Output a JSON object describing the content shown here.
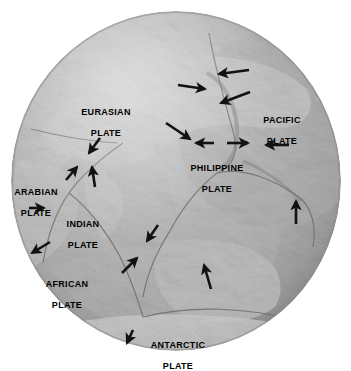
{
  "figure": {
    "kind": "relief-globe-map",
    "title_visible": false,
    "background_color": "#ffffff",
    "globe": {
      "center_x": 176,
      "center_y": 181,
      "radius_x": 165,
      "radius_y": 170,
      "shading": "grayscale shaded-relief hemisphere centered on the Indian Ocean / eastern Asia",
      "colors": {
        "ocean_light": "#c9c9c9",
        "ocean_mid": "#b4b4b4",
        "land_light": "#dcdcdc",
        "land_shadow": "#8e8e8e",
        "limb_dark": "#707070",
        "highlight": "#efefef"
      }
    },
    "labels": [
      {
        "id": "eurasian",
        "line1": "EURASIAN",
        "line2": "PLATE",
        "x": 73,
        "y": 96
      },
      {
        "id": "pacific",
        "line1": "PACIFIC",
        "line2": "PLATE",
        "x": 258,
        "y": 104
      },
      {
        "id": "philippine",
        "line1": "PHILIPPINE",
        "line2": "PLATE",
        "x": 182,
        "y": 152
      },
      {
        "id": "arabian",
        "line1": "ARABIAN",
        "line2": "PLATE",
        "x": 8,
        "y": 176
      },
      {
        "id": "indian",
        "line1": "INDIAN",
        "line2": "PLATE",
        "x": 58,
        "y": 208
      },
      {
        "id": "african",
        "line1": "AFRICAN",
        "line2": "PLATE",
        "x": 41,
        "y": 268
      },
      {
        "id": "antarctic",
        "line1": "ANTARCTIC",
        "line2": "PLATE",
        "x": 146,
        "y": 329
      }
    ],
    "arrows": [
      {
        "id": "pacific-west-north",
        "desc": "Pacific plate moving west, north of Japan",
        "x1": 249,
        "y1": 70,
        "x2": 217,
        "y2": 74
      },
      {
        "id": "pacific-west-mid",
        "desc": "Pacific plate moving west-southwest toward Japan",
        "x1": 250,
        "y1": 92,
        "x2": 219,
        "y2": 104
      },
      {
        "id": "eurasia-east",
        "desc": "Eurasian plate moving east",
        "x1": 178,
        "y1": 85,
        "x2": 207,
        "y2": 89
      },
      {
        "id": "philippine-southeast",
        "desc": "motion southeast toward Philippine trench",
        "x1": 166,
        "y1": 123,
        "x2": 192,
        "y2": 140
      },
      {
        "id": "philippine-west-1",
        "desc": "Philippine plate moving west",
        "x1": 214,
        "y1": 143,
        "x2": 194,
        "y2": 143
      },
      {
        "id": "philippine-east",
        "desc": "motion east into Pacific boundary",
        "x1": 227,
        "y1": 143,
        "x2": 250,
        "y2": 143
      },
      {
        "id": "pacific-west-south",
        "desc": "Pacific plate moving west",
        "x1": 289,
        "y1": 145,
        "x2": 264,
        "y2": 145
      },
      {
        "id": "eurasia-southwest",
        "desc": "Eurasian plate moving southwest over Himalaya",
        "x1": 100,
        "y1": 138,
        "x2": 88,
        "y2": 155
      },
      {
        "id": "arabian-northeast",
        "desc": "Arabian plate moving northeast",
        "x1": 66,
        "y1": 180,
        "x2": 78,
        "y2": 165
      },
      {
        "id": "indian-north",
        "desc": "Indian plate moving north into Eurasia",
        "x1": 95,
        "y1": 187,
        "x2": 92,
        "y2": 165
      },
      {
        "id": "arabian-east",
        "desc": "Arabian plate moving east",
        "x1": 29,
        "y1": 208,
        "x2": 46,
        "y2": 208
      },
      {
        "id": "africa-southwest",
        "desc": "African plate moving southwest",
        "x1": 50,
        "y1": 242,
        "x2": 30,
        "y2": 254
      },
      {
        "id": "indo-australia-south",
        "desc": "subduction southeast at the Java trench",
        "x1": 158,
        "y1": 225,
        "x2": 146,
        "y2": 243
      },
      {
        "id": "australia-northeast",
        "desc": "Australian plate moving northeast",
        "x1": 122,
        "y1": 273,
        "x2": 138,
        "y2": 256
      },
      {
        "id": "australia-north",
        "desc": "Australian plate moving north",
        "x1": 211,
        "y1": 289,
        "x2": 203,
        "y2": 263
      },
      {
        "id": "pacific-north-east",
        "desc": "motion north along eastern Australian margin",
        "x1": 296,
        "y1": 224,
        "x2": 296,
        "y2": 199
      },
      {
        "id": "antarctic-southwest",
        "desc": "Antarctic plate moving southwest",
        "x1": 133,
        "y1": 330,
        "x2": 126,
        "y2": 344
      }
    ],
    "legend": {
      "present": false
    },
    "arrow_color": "#121212",
    "label_color": "#000000"
  }
}
